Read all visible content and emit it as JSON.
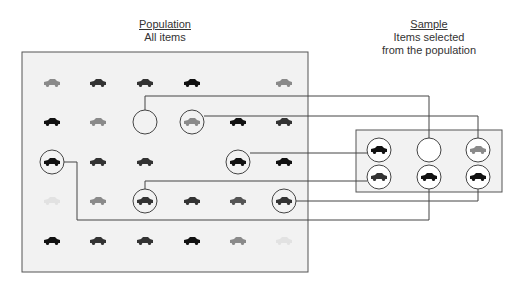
{
  "population": {
    "title": "Population",
    "subtitle": "All items",
    "grid": [
      [
        "gray",
        "dark",
        "dark",
        "black",
        null,
        "gray"
      ],
      [
        "black",
        "gray",
        "empty-selected",
        "gray",
        "black",
        "dark"
      ],
      [
        "black",
        "dark",
        "dark",
        null,
        "black",
        "black"
      ],
      [
        "faint",
        "gray",
        "dark",
        "dark",
        "darkgray",
        "dark"
      ],
      [
        "black",
        "dark",
        "dark",
        "black",
        "gray",
        "faint"
      ]
    ],
    "selected": [
      {
        "row": 1,
        "col": 2,
        "to": "s-0-1"
      },
      {
        "row": 1,
        "col": 3,
        "to": "s-0-2"
      },
      {
        "row": 2,
        "col": 4,
        "to": "s-0-0"
      },
      {
        "row": 3,
        "col": 2,
        "to": "s-1-0"
      },
      {
        "row": 3,
        "col": 5,
        "to": "s-1-2"
      },
      {
        "row": 2,
        "col": 0,
        "to": "s-1-1"
      }
    ]
  },
  "sample": {
    "title": "Sample",
    "subtitle_line1": "Items selected",
    "subtitle_line2": "from the population",
    "grid": [
      [
        "black",
        "empty",
        "gray"
      ],
      [
        "dark",
        "black",
        "black"
      ]
    ]
  },
  "colors": {
    "black": "#111111",
    "dark": "#333333",
    "darkgray": "#555555",
    "gray": "#8a8a8a",
    "faint": "#e2e2e2",
    "line": "#444444",
    "box_fill": "#f2f2f2",
    "box_stroke": "#555555"
  }
}
